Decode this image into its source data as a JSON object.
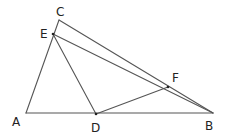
{
  "diagram": {
    "type": "geometry",
    "stroke_color": "#555555",
    "points": {
      "A": {
        "label": "A",
        "x": 26,
        "y": 113,
        "lx": 12,
        "ly": 126
      },
      "B": {
        "label": "B",
        "x": 213,
        "y": 113,
        "lx": 205,
        "ly": 130
      },
      "C": {
        "label": "C",
        "x": 59,
        "y": 20,
        "lx": 56,
        "ly": 16
      },
      "D": {
        "label": "D",
        "x": 96,
        "y": 114,
        "lx": 91,
        "ly": 132
      },
      "E": {
        "label": "E",
        "x": 53,
        "y": 34,
        "lx": 40,
        "ly": 38
      },
      "F": {
        "label": "F",
        "x": 168,
        "y": 87,
        "lx": 172,
        "ly": 82
      }
    },
    "segments": [
      [
        "A",
        "C"
      ],
      [
        "C",
        "B"
      ],
      [
        "E",
        "B"
      ],
      [
        "E",
        "D"
      ],
      [
        "D",
        "F"
      ],
      [
        "A",
        "B"
      ]
    ]
  }
}
